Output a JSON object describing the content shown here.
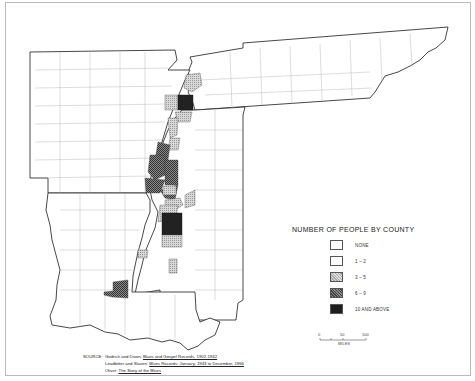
{
  "map": {
    "title": "",
    "states_shown": [
      "Tennessee",
      "Arkansas",
      "Mississippi",
      "Louisiana"
    ],
    "fill_colors": {
      "none": "#ffffff",
      "1-2": "#c8c8c8",
      "3-5": "#a8a8a8",
      "6-9": "#6a6a6a",
      "10_and_above": "#222222"
    }
  },
  "legend": {
    "title": "NUMBER OF PEOPLE BY COUNTY",
    "items": [
      {
        "label": "NONE",
        "fill": "#ffffff"
      },
      {
        "label": "1 – 2",
        "fill": "#ffffff"
      },
      {
        "label": "3 – 5",
        "fill": "#c9c9c9"
      },
      {
        "label": "6 – 9",
        "fill": "#6d6d6d"
      },
      {
        "label": "10 AND ABOVE",
        "fill": "#1e1e1e"
      }
    ]
  },
  "scale": {
    "ticks": [
      "0",
      "50",
      "100"
    ],
    "unit": "MILES"
  },
  "source": {
    "key": "SOURCE:",
    "lines": [
      {
        "prefix": "Godrich and Dixon: ",
        "title": "Blues and Gospel Records, 1902-1942",
        "suffix": ""
      },
      {
        "prefix": "Leadbitter and Slaven: ",
        "title": "Blues Records: January, 1943 to December, 1966",
        "suffix": ""
      },
      {
        "prefix": "Oliver: ",
        "title": "The Story of the Blues",
        "suffix": ""
      }
    ]
  }
}
